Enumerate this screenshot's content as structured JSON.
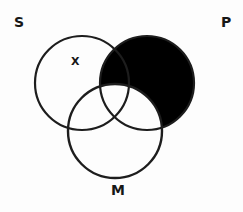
{
  "diagram": {
    "kind": "venn-diagram",
    "title_labels": {
      "subject": "S",
      "predicate": "P",
      "middle": "M"
    },
    "marks": {
      "existential_x": "X"
    },
    "colors": {
      "background": "#fdfdfd",
      "stroke": "#1d1d1d",
      "shaded_fill": "#000000",
      "unshaded_fill": "#ffffff",
      "label_color": "#171717"
    },
    "circles": [
      {
        "name": "S",
        "label": "S",
        "cx": 82,
        "cy": 83,
        "r": 47,
        "filled": false
      },
      {
        "name": "P",
        "label": "P",
        "cx": 147,
        "cy": 83,
        "r": 47,
        "filled": true
      },
      {
        "name": "M",
        "label": "M",
        "cx": 115,
        "cy": 131,
        "r": 47,
        "filled": false
      }
    ],
    "regions": [
      {
        "name": "S-only",
        "shaded": false,
        "mark": "X"
      },
      {
        "name": "P-only",
        "shaded": true,
        "mark": ""
      },
      {
        "name": "M-only",
        "shaded": false,
        "mark": ""
      },
      {
        "name": "S-and-P",
        "shaded": true,
        "mark": ""
      },
      {
        "name": "S-and-M",
        "shaded": false,
        "mark": ""
      },
      {
        "name": "P-and-M",
        "shaded": false,
        "mark": ""
      },
      {
        "name": "S-and-P-and-M",
        "shaded": false,
        "mark": ""
      }
    ]
  }
}
